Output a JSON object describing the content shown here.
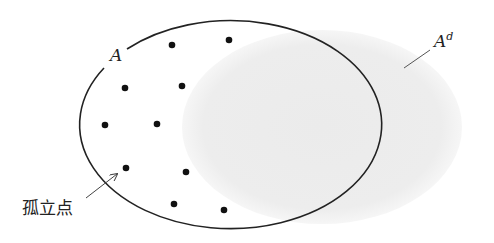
{
  "diagram": {
    "set_label": "A",
    "derived_set_label_base": "A",
    "derived_set_label_sup": "d",
    "isolated_point_label": "孤立点",
    "colors": {
      "outline": "#222222",
      "derived_fill": "#ececec",
      "dot": "#111111",
      "arrow": "#444444"
    },
    "set_ellipse": {
      "cx": 231,
      "cy": 126,
      "rx": 151,
      "ry": 104
    },
    "derived_region": {
      "cx": 322,
      "cy": 127,
      "rx": 140,
      "ry": 97
    },
    "points": [
      {
        "x": 172,
        "y": 45
      },
      {
        "x": 229,
        "y": 40
      },
      {
        "x": 125,
        "y": 88
      },
      {
        "x": 182,
        "y": 86
      },
      {
        "x": 105,
        "y": 125
      },
      {
        "x": 157,
        "y": 124
      },
      {
        "x": 126,
        "y": 168
      },
      {
        "x": 186,
        "y": 172
      },
      {
        "x": 174,
        "y": 204
      },
      {
        "x": 224,
        "y": 210
      }
    ]
  }
}
